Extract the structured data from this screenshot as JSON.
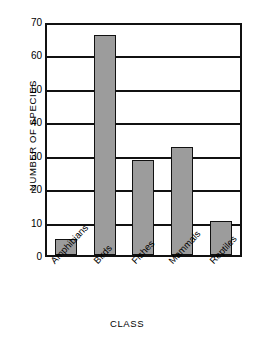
{
  "chart_data": {
    "type": "bar",
    "title": "",
    "subtitle": "",
    "xlabel": "CLASS",
    "ylabel": "NUMBER OF SPECIES",
    "categories": [
      "Amphibians",
      "Birds",
      "Fishes",
      "Mammals",
      "Reptiles"
    ],
    "values": [
      5,
      67,
      29,
      33,
      10.5
    ],
    "ylim": [
      0,
      70
    ],
    "ytick_labels": [
      "0",
      "10",
      "20",
      "30",
      "40",
      "50",
      "60",
      "70"
    ],
    "ytick_values": [
      0,
      10,
      20,
      30,
      40,
      50,
      60,
      70
    ],
    "grid": "horizontal",
    "legend": "none",
    "bar_color": "#9c9c9c",
    "bar_border_color": "#111111",
    "axis_color": "#111111",
    "background": "#ffffff"
  }
}
